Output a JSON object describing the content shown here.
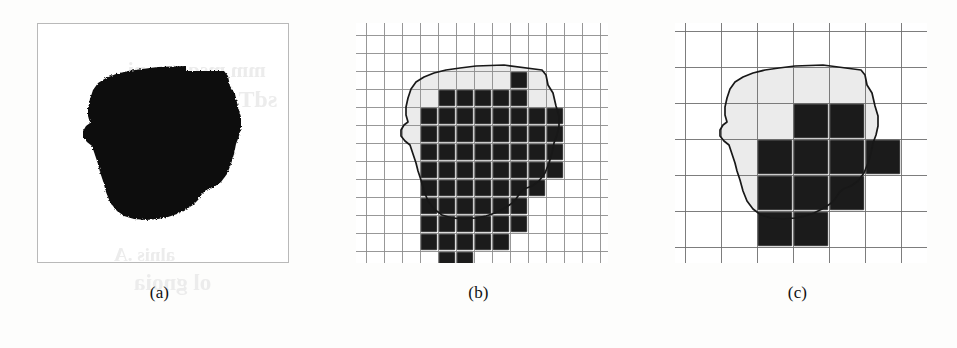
{
  "figure": {
    "kind": "grid-quantization-illustration",
    "panels": [
      {
        "id": "a",
        "caption": "(a)",
        "description": "original binary object silhouette",
        "grid": null,
        "object_color": "#111111",
        "frame_color": "#b9b9b9"
      },
      {
        "id": "b",
        "caption": "(b)",
        "description": "object overlaid with a fine square grid; cells whose centre falls inside the boundary are filled",
        "grid": {
          "cols": 14,
          "rows": 13,
          "cell_px": 18,
          "line_color": "#8d8d8d"
        },
        "object_color": "#1b1b1b",
        "filled_cells": [
          [
            6,
            0
          ],
          [
            2,
            1
          ],
          [
            3,
            1
          ],
          [
            4,
            1
          ],
          [
            5,
            1
          ],
          [
            6,
            1
          ],
          [
            1,
            2
          ],
          [
            2,
            2
          ],
          [
            3,
            2
          ],
          [
            4,
            2
          ],
          [
            5,
            2
          ],
          [
            6,
            2
          ],
          [
            7,
            2
          ],
          [
            8,
            2
          ],
          [
            1,
            3
          ],
          [
            2,
            3
          ],
          [
            3,
            3
          ],
          [
            4,
            3
          ],
          [
            5,
            3
          ],
          [
            6,
            3
          ],
          [
            7,
            3
          ],
          [
            8,
            3
          ],
          [
            1,
            4
          ],
          [
            2,
            4
          ],
          [
            3,
            4
          ],
          [
            4,
            4
          ],
          [
            5,
            4
          ],
          [
            6,
            4
          ],
          [
            7,
            4
          ],
          [
            8,
            4
          ],
          [
            1,
            5
          ],
          [
            2,
            5
          ],
          [
            3,
            5
          ],
          [
            4,
            5
          ],
          [
            5,
            5
          ],
          [
            6,
            5
          ],
          [
            7,
            5
          ],
          [
            8,
            5
          ],
          [
            1,
            6
          ],
          [
            2,
            6
          ],
          [
            3,
            6
          ],
          [
            4,
            6
          ],
          [
            5,
            6
          ],
          [
            6,
            6
          ],
          [
            7,
            6
          ],
          [
            1,
            7
          ],
          [
            2,
            7
          ],
          [
            3,
            7
          ],
          [
            4,
            7
          ],
          [
            5,
            7
          ],
          [
            6,
            7
          ],
          [
            1,
            8
          ],
          [
            2,
            8
          ],
          [
            3,
            8
          ],
          [
            4,
            8
          ],
          [
            5,
            8
          ],
          [
            6,
            8
          ],
          [
            1,
            9
          ],
          [
            2,
            9
          ],
          [
            3,
            9
          ],
          [
            4,
            9
          ],
          [
            5,
            9
          ],
          [
            2,
            10
          ],
          [
            3,
            10
          ]
        ],
        "filled_count": 66
      },
      {
        "id": "c",
        "caption": "(c)",
        "description": "same object overlaid with a coarse square grid; far fewer cells are retained",
        "grid": {
          "cols": 8,
          "rows": 8,
          "cell_px": 36,
          "line_color": "#6f6f6f"
        },
        "object_color": "#1b1b1b",
        "filled_cells": [
          [
            2,
            1
          ],
          [
            3,
            1
          ],
          [
            1,
            2
          ],
          [
            2,
            2
          ],
          [
            3,
            2
          ],
          [
            4,
            2
          ],
          [
            1,
            3
          ],
          [
            2,
            3
          ],
          [
            3,
            3
          ],
          [
            1,
            4
          ],
          [
            2,
            4
          ]
        ],
        "filled_count": 11
      }
    ]
  },
  "ghost_text": {
    "line1": "mm msqotqs ni",
    "line2": "sdT .ииV qm",
    "line3": "alnis .A",
    "line4": "ol gnoia",
    "line5": "noitsmixo"
  }
}
